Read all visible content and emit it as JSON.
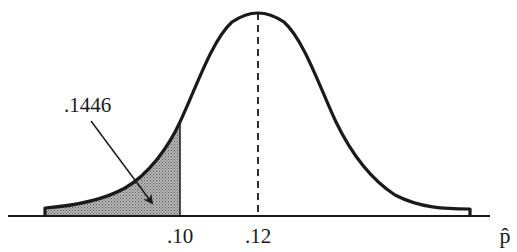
{
  "diagram": {
    "type": "normal-distribution-curve",
    "mean_label": ".12",
    "cutoff_label": ".10",
    "axis_label": "p̂",
    "area_label": ".1446",
    "shaded_region": "left tail, p-hat below .10",
    "colors": {
      "curve": "#1a1a1a",
      "shade": "#9a9a9a",
      "axis": "#1a1a1a",
      "background": "#ffffff"
    }
  }
}
